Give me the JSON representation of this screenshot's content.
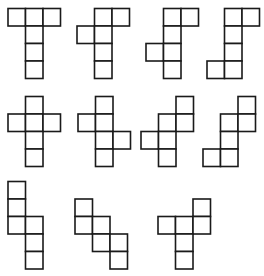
{
  "diagram": {
    "title": "",
    "cell_size": 17.5,
    "stroke_color": "#1a1a1a",
    "fill_color": "#ffffff",
    "nets": [
      {
        "id": "net-1",
        "origin": [
          8,
          8.5
        ],
        "cells": [
          [
            0,
            0
          ],
          [
            1,
            0
          ],
          [
            2,
            0
          ],
          [
            1,
            1
          ],
          [
            1,
            2
          ],
          [
            1,
            3
          ]
        ]
      },
      {
        "id": "net-2",
        "origin": [
          77,
          8.5
        ],
        "cells": [
          [
            1,
            0
          ],
          [
            2,
            0
          ],
          [
            0,
            1
          ],
          [
            1,
            1
          ],
          [
            1,
            2
          ],
          [
            1,
            3
          ]
        ]
      },
      {
        "id": "net-3",
        "origin": [
          146,
          8.5
        ],
        "cells": [
          [
            1,
            0
          ],
          [
            2,
            0
          ],
          [
            1,
            1
          ],
          [
            0,
            2
          ],
          [
            1,
            2
          ],
          [
            1,
            3
          ]
        ]
      },
      {
        "id": "net-4",
        "origin": [
          207,
          8.5
        ],
        "cells": [
          [
            1,
            0
          ],
          [
            2,
            0
          ],
          [
            1,
            1
          ],
          [
            1,
            2
          ],
          [
            0,
            3
          ],
          [
            1,
            3
          ]
        ]
      },
      {
        "id": "net-5",
        "origin": [
          8,
          96.5
        ],
        "cells": [
          [
            1,
            0
          ],
          [
            0,
            1
          ],
          [
            1,
            1
          ],
          [
            2,
            1
          ],
          [
            1,
            2
          ],
          [
            1,
            3
          ]
        ]
      },
      {
        "id": "net-6",
        "origin": [
          78,
          96.5
        ],
        "cells": [
          [
            1,
            0
          ],
          [
            0,
            1
          ],
          [
            1,
            1
          ],
          [
            1,
            2
          ],
          [
            2,
            2
          ],
          [
            1,
            3
          ]
        ]
      },
      {
        "id": "net-7",
        "origin": [
          141,
          96.5
        ],
        "cells": [
          [
            2,
            0
          ],
          [
            1,
            1
          ],
          [
            2,
            1
          ],
          [
            0,
            2
          ],
          [
            1,
            2
          ],
          [
            1,
            3
          ]
        ]
      },
      {
        "id": "net-8",
        "origin": [
          203,
          96.5
        ],
        "cells": [
          [
            2,
            0
          ],
          [
            1,
            1
          ],
          [
            2,
            1
          ],
          [
            1,
            2
          ],
          [
            0,
            3
          ],
          [
            1,
            3
          ]
        ]
      },
      {
        "id": "net-9",
        "origin": [
          8,
          181.5
        ],
        "cells": [
          [
            0,
            0
          ],
          [
            0,
            1
          ],
          [
            0,
            2
          ],
          [
            1,
            2
          ],
          [
            1,
            3
          ],
          [
            1,
            4
          ]
        ]
      },
      {
        "id": "net-10",
        "origin": [
          75,
          199
        ],
        "cells": [
          [
            0,
            0
          ],
          [
            0,
            1
          ],
          [
            1,
            1
          ],
          [
            1,
            2
          ],
          [
            2,
            2
          ],
          [
            2,
            3
          ]
        ]
      },
      {
        "id": "net-11",
        "origin": [
          158,
          199
        ],
        "cells": [
          [
            2,
            0
          ],
          [
            0,
            1
          ],
          [
            1,
            1
          ],
          [
            2,
            1
          ],
          [
            1,
            2
          ],
          [
            1,
            3
          ]
        ]
      }
    ]
  }
}
